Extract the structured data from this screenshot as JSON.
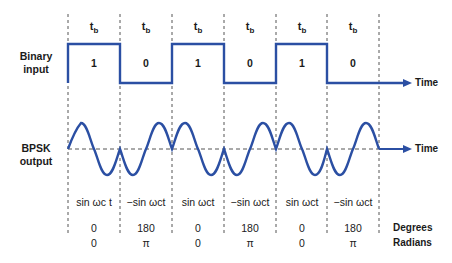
{
  "diagram": {
    "title_rows": {
      "binary_input_label": "Binary input",
      "bpsk_output_label": "BPSK output",
      "time_label_binary": "Time",
      "time_label_bpsk": "Time",
      "degrees_label": "Degrees",
      "radians_label": "Radians"
    },
    "bit_period_label": "t",
    "bit_period_sub": "b",
    "bits": [
      "1",
      "0",
      "1",
      "0",
      "1",
      "0"
    ],
    "outputs": [
      "sin ωc t",
      "−sin ωct",
      "sin ωct",
      "−sin ωct",
      "sin ωct",
      "−sin ωct"
    ],
    "degrees": [
      "0",
      "180",
      "0",
      "180",
      "0",
      "180"
    ],
    "radians": [
      "0",
      "π",
      "0",
      "π",
      "0",
      "π"
    ],
    "colors": {
      "signal": "#2b4fa3",
      "dashes": "#555555",
      "text": "#1a1a1a"
    }
  }
}
